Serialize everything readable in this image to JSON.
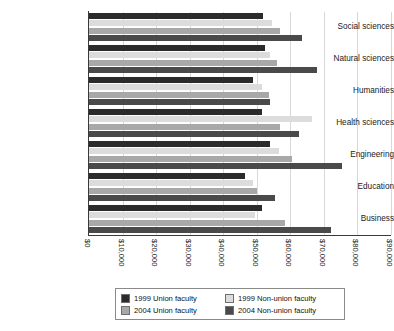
{
  "chart_data": {
    "type": "bar",
    "orientation": "horizontal",
    "title": "",
    "xlabel": "",
    "ylabel": "",
    "xlim": [
      0,
      90000
    ],
    "xticks": [
      "$0",
      "$10,000",
      "$20,000",
      "$30,000",
      "$40,000",
      "$50,000",
      "$60,000",
      "$70,000",
      "$80,000",
      "$90,000"
    ],
    "xtick_values": [
      0,
      10000,
      20000,
      30000,
      40000,
      50000,
      60000,
      70000,
      80000,
      90000
    ],
    "grid": true,
    "legend_position": "bottom",
    "categories": [
      "Social sciences",
      "Natural sciences",
      "Humanities",
      "Health sciences",
      "Engineering",
      "Education",
      "Business"
    ],
    "series": [
      {
        "name": "1999 Union faculty",
        "color": "#2b2b2b",
        "values": [
          52000,
          52500,
          49000,
          51500,
          54000,
          46500,
          51500
        ]
      },
      {
        "name": "1999 Non-union faculty",
        "color": "#dcdcdc",
        "values": [
          54500,
          54000,
          51500,
          66500,
          56500,
          49000,
          49500
        ]
      },
      {
        "name": "2004 Union faculty",
        "color": "#a8a8a8",
        "values": [
          57000,
          56000,
          53500,
          57000,
          60500,
          50000,
          58500
        ]
      },
      {
        "name": "2004 Non-union faculty",
        "color": "#4a4a4a",
        "values": [
          63500,
          68000,
          54000,
          62500,
          75500,
          55500,
          72000
        ]
      }
    ]
  },
  "legend": {
    "entries": [
      {
        "label": "1999 Union faculty"
      },
      {
        "label": "1999 Non-union faculty"
      },
      {
        "label": "2004 Union faculty"
      },
      {
        "label": "2004 Non-union faculty"
      }
    ]
  }
}
